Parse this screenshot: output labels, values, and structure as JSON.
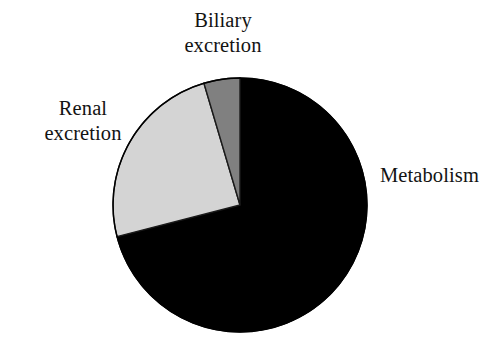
{
  "figure": {
    "title": "",
    "background_color": "#ffffff",
    "width": 503,
    "height": 344
  },
  "chart_data": {
    "type": "pie",
    "title": "",
    "xlabel": "",
    "ylabel": "",
    "legend_position": "none",
    "grid": false,
    "center": {
      "x": 240,
      "y": 205
    },
    "radius": 127,
    "start_angle_deg": 0,
    "direction": "clockwise",
    "categories": [
      "Metabolism",
      "Renal excretion",
      "Biliary excretion"
    ],
    "values": [
      71,
      24,
      5
    ],
    "value_unit": "percent",
    "slices": [
      {
        "label": "Metabolism",
        "value": 71,
        "color": "#000000",
        "start_angle_deg": 0,
        "end_angle_deg": 255.6,
        "label_position": "right"
      },
      {
        "label": "Renal excretion",
        "value": 24,
        "color": "#d4d4d4",
        "start_angle_deg": 255.6,
        "end_angle_deg": 343.5,
        "label_position": "left"
      },
      {
        "label": "Biliary excretion",
        "value": 5,
        "color": "#808080",
        "start_angle_deg": 343.5,
        "end_angle_deg": 360,
        "label_position": "top"
      }
    ],
    "outline_color": "#000000"
  },
  "labels": {
    "biliary": {
      "line1": "Biliary",
      "line2": "excretion"
    },
    "renal": {
      "line1": "Renal",
      "line2": "excretion"
    },
    "metabolism": {
      "line1": "Metabolism"
    }
  }
}
